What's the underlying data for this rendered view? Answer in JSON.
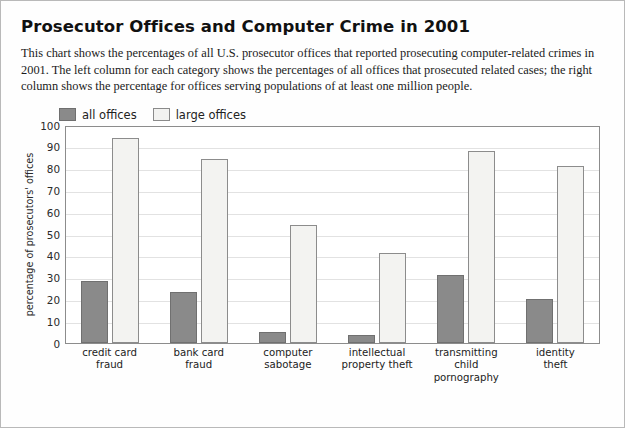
{
  "title": "Prosecutor Offices and Computer Crime in 2001",
  "description": "This chart shows the percentages of all U.S. prosecutor offices that reported prosecuting computer-related crimes in 2001. The left column for each category shows the percentages of all offices that prosecuted related cases; the right column shows the percentage for offices serving populations of at least one million people.",
  "legend": [
    {
      "label": "all offices",
      "color": "#8a8a8a"
    },
    {
      "label": "large offices",
      "color": "#f2f2f0"
    }
  ],
  "chart_data": {
    "type": "bar",
    "title": "Prosecutor Offices and Computer Crime in 2001",
    "xlabel": "",
    "ylabel": "percentage of prosecutors' offices",
    "ylim": [
      0,
      100
    ],
    "yticks": [
      100,
      90,
      80,
      70,
      60,
      50,
      40,
      30,
      20,
      10,
      0
    ],
    "grid": true,
    "legend_position": "above-plot-left",
    "categories": [
      "credit card\nfraud",
      "bank card\nfraud",
      "computer\nsabotage",
      "intellectual\nproperty theft",
      "transmitting\nchild pornography",
      "identity\ntheft"
    ],
    "category_lines": [
      [
        "credit card",
        "fraud"
      ],
      [
        "bank card",
        "fraud"
      ],
      [
        "computer",
        "sabotage"
      ],
      [
        "intellectual",
        "property theft"
      ],
      [
        "transmitting",
        "child pornography"
      ],
      [
        "identity",
        "theft"
      ]
    ],
    "series": [
      {
        "name": "all offices",
        "color": "#8a8a8a",
        "values": [
          28,
          23,
          5,
          3.5,
          31,
          20
        ]
      },
      {
        "name": "large offices",
        "color": "#f2f2f0",
        "values": [
          94,
          84,
          54,
          41,
          88,
          81
        ]
      }
    ]
  }
}
